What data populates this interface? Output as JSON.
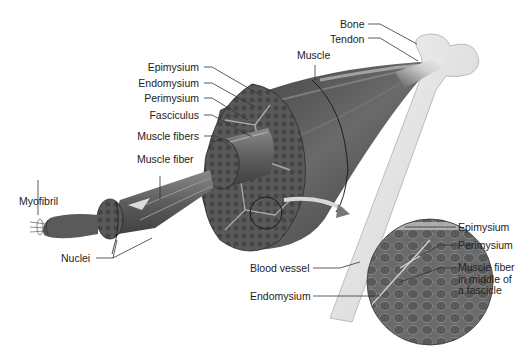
{
  "diagram": {
    "labels": {
      "bone": "Bone",
      "tendon": "Tendon",
      "muscle": "Muscle",
      "epimysium": "Epimysium",
      "endomysium": "Endomysium",
      "perimysium": "Perimysium",
      "fasciculus": "Fasciculus",
      "muscle_fibers": "Muscle fibers",
      "muscle_fiber": "Muscle fiber",
      "myofibril": "Myofibril",
      "nuclei": "Nuclei"
    },
    "micrograph_labels": {
      "epimysium": "Epimysium",
      "perimysium": "Perimysium",
      "blood_vessel": "Blood vessel",
      "muscle_fiber_line1": "Muscle fiber",
      "muscle_fiber_line2": "in middle of",
      "muscle_fiber_line3": "a fascicle",
      "endomysium": "Endomysium"
    },
    "colors": {
      "muscle_dark": "#4a4a4a",
      "muscle_mid": "#6e6e6e",
      "bone": "#e6e6e6",
      "leader_line": "#333333",
      "background": "#ffffff"
    }
  }
}
